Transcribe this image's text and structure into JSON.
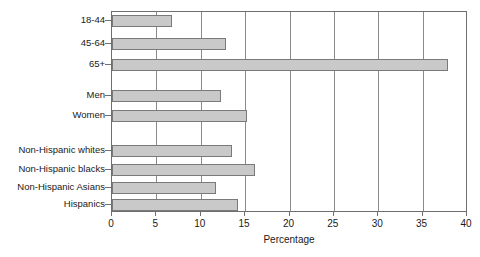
{
  "chart_data": {
    "type": "bar",
    "orientation": "horizontal",
    "title": "",
    "xlabel": "Percentage",
    "ylabel": "",
    "xlim": [
      0,
      40
    ],
    "xticks": [
      0,
      5,
      10,
      15,
      20,
      25,
      30,
      35,
      40
    ],
    "grid": "vertical",
    "legend": null,
    "groups": [
      {
        "name": "Age",
        "categories": [
          "18-44",
          "45-64",
          "65+"
        ],
        "values": [
          6.8,
          12.9,
          37.9
        ]
      },
      {
        "name": "Sex",
        "categories": [
          "Men",
          "Women"
        ],
        "values": [
          12.3,
          15.2
        ]
      },
      {
        "name": "Race/Ethnicity",
        "categories": [
          "Non-Hispanic whites",
          "Non-Hispanic blacks",
          "Non-Hispanic Asians",
          "Hispanics"
        ],
        "values": [
          13.5,
          16.1,
          11.7,
          14.2
        ]
      }
    ],
    "categories": [
      "18-44",
      "45-64",
      "65+",
      "Men",
      "Women",
      "Non-Hispanic whites",
      "Non-Hispanic blacks",
      "Non-Hispanic Asians",
      "Hispanics"
    ],
    "values": [
      6.8,
      12.9,
      37.9,
      12.3,
      15.2,
      13.5,
      16.1,
      11.7,
      14.2
    ],
    "colors": {
      "bar_fill": "#c9c9c9",
      "bar_edge": "#7a7a7a",
      "grid": "#8a8a8a",
      "frame": "#6f6f6f",
      "text": "#1a1a1a",
      "background": "#ffffff"
    }
  }
}
